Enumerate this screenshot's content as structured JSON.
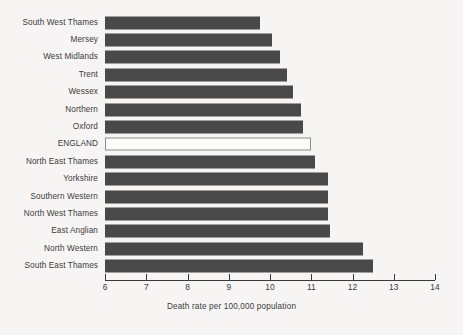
{
  "chart_data": {
    "type": "bar",
    "orientation": "horizontal",
    "title": "",
    "xlabel": "Death rate per 100,000 population",
    "ylabel": "",
    "xlim": [
      6,
      14
    ],
    "xticks": [
      "6",
      "7",
      "8",
      "9",
      "10",
      "11",
      "12",
      "13",
      "14"
    ],
    "grid": false,
    "legend": null,
    "categories": [
      "South West Thames",
      "Mersey",
      "West Midlands",
      "Trent",
      "Wessex",
      "Northern",
      "Oxford",
      "ENGLAND",
      "North East Thames",
      "Yorkshire",
      "Southern Western",
      "North West Thames",
      "East Anglian",
      "North Western",
      "South East Thames"
    ],
    "values": [
      9.75,
      10.05,
      10.25,
      10.4,
      10.55,
      10.75,
      10.8,
      11.0,
      11.1,
      11.4,
      11.4,
      11.4,
      11.45,
      12.25,
      12.5
    ],
    "highlight_category": "ENGLAND",
    "colors": {
      "bar": "#494949",
      "highlight_fill": "#fbfbf9",
      "highlight_border": "#8c8c8c",
      "axis": "#3a3a3a",
      "text": "#3b3b3b",
      "background": "#f6f5f3"
    }
  }
}
